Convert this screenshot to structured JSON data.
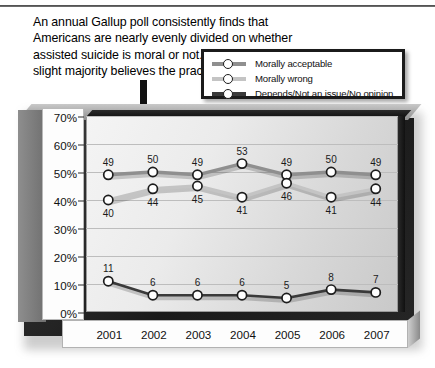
{
  "caption": {
    "text": "An annual Gallup poll consistently finds that Americans are nearly evenly divided on whether assisted suicide is moral or not. However, a slight majority believes the practice is moral."
  },
  "legend": {
    "position": "top-right",
    "items": [
      {
        "label": "Morally acceptable",
        "color": "#8f8f8f"
      },
      {
        "label": "Morally wrong",
        "color": "#c4c4c4"
      },
      {
        "label": "Depends/Not an issue/No opinion",
        "color": "#3a3a3a"
      }
    ]
  },
  "chart_data": {
    "type": "line",
    "title": "",
    "subtitle": "",
    "xlabel": "",
    "ylabel": "",
    "x": [
      "2001",
      "2002",
      "2003",
      "2004",
      "2005",
      "2006",
      "2007"
    ],
    "categories": [
      "2001",
      "2002",
      "2003",
      "2004",
      "2005",
      "2006",
      "2007"
    ],
    "ylim": [
      0,
      70
    ],
    "yticks": [
      "0%",
      "10%",
      "20%",
      "30%",
      "40%",
      "50%",
      "60%",
      "70%"
    ],
    "ytick_values": [
      0,
      10,
      20,
      30,
      40,
      50,
      60,
      70
    ],
    "grid": true,
    "legend_position": "top-right",
    "data_labels": true,
    "series": [
      {
        "name": "Morally acceptable",
        "color": "#8f8f8f",
        "values": [
          49,
          50,
          49,
          53,
          49,
          50,
          49
        ],
        "label_offsets": [
          "above",
          "above",
          "above",
          "above",
          "above",
          "above",
          "above"
        ]
      },
      {
        "name": "Morally wrong",
        "color": "#c4c4c4",
        "values": [
          40,
          44,
          45,
          41,
          46,
          41,
          44
        ],
        "label_offsets": [
          "below",
          "below",
          "below",
          "below",
          "below",
          "below",
          "below"
        ]
      },
      {
        "name": "Depends/Not an issue/No opinion",
        "color": "#3a3a3a",
        "values": [
          11,
          6,
          6,
          6,
          5,
          8,
          7
        ],
        "label_offsets": [
          "above",
          "above",
          "above",
          "above",
          "above",
          "above",
          "above"
        ]
      }
    ]
  }
}
